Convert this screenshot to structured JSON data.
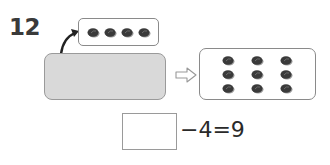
{
  "problem": {
    "number": "12",
    "top_group": {
      "count": 4,
      "icon": "dark-bean-icon"
    },
    "hidden_group": {
      "description": "gray box covering unknown items"
    },
    "result_group": {
      "count": 9,
      "rows": 3,
      "cols": 3,
      "icon": "dark-bean-icon"
    },
    "transform_arrow": "hollow-right-arrow",
    "equation": {
      "blank_value": "",
      "text": "−4=9",
      "operator": "−",
      "subtrahend": "4",
      "equals": "=",
      "result": "9"
    }
  },
  "colors": {
    "item_fill": "#3a3a3a",
    "item_shadow": "#9a9a9a",
    "gray_box_fill": "#d9d9d9",
    "border": "#8a8a8a",
    "text": "#2a2a2a"
  }
}
